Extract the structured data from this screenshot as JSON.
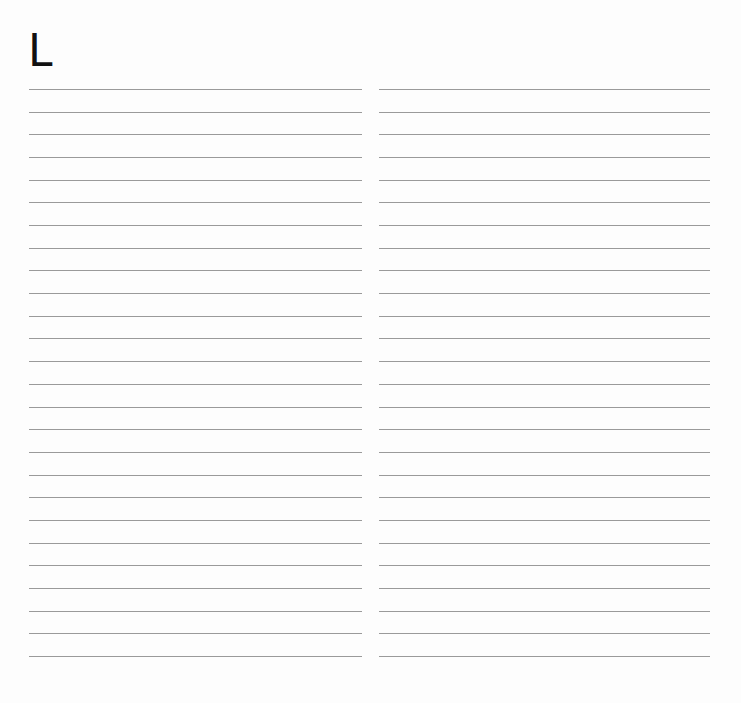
{
  "page": {
    "heading_letter": "L",
    "background": "#fdfdfd",
    "line_color": "#9a9a9a"
  },
  "ruled_columns": [
    {
      "name": "left",
      "line_count": 26,
      "first_line_y": 89,
      "line_spacing": 22.68
    },
    {
      "name": "right",
      "line_count": 26,
      "first_line_y": 89,
      "line_spacing": 22.68
    }
  ]
}
